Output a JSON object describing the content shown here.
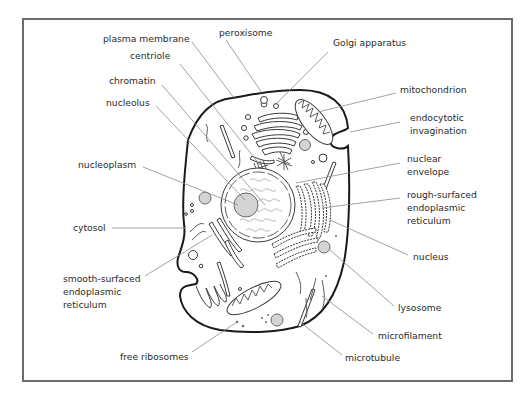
{
  "diagram": {
    "colors": {
      "frame": "#6b6b6b",
      "membrane": "#1a1a1a",
      "organelle_fill_grey": "#d4d4d4",
      "leader_line": "#8a8a8a",
      "text": "#2a2a2a"
    },
    "labels": [
      {
        "id": "plasma-membrane",
        "lines": [
          "plasma membrane"
        ],
        "x": 103,
        "y": 42,
        "anchor": "start",
        "leader": [
          [
            192,
            42
          ],
          [
            234,
            98
          ]
        ]
      },
      {
        "id": "centriole",
        "lines": [
          "centriole"
        ],
        "x": 130,
        "y": 59,
        "anchor": "start",
        "leader": [
          [
            180,
            64
          ],
          [
            260,
            165
          ]
        ]
      },
      {
        "id": "chromatin",
        "lines": [
          "chromatin"
        ],
        "x": 109,
        "y": 84,
        "anchor": "start",
        "leader": [
          [
            162,
            85
          ],
          [
            265,
            205
          ]
        ]
      },
      {
        "id": "nucleolus",
        "lines": [
          "nucleolus"
        ],
        "x": 106,
        "y": 106,
        "anchor": "start",
        "leader": [
          [
            156,
            106
          ],
          [
            245,
            200
          ]
        ]
      },
      {
        "id": "peroxisome",
        "lines": [
          "peroxisome"
        ],
        "x": 219,
        "y": 36,
        "anchor": "start",
        "leader": [
          [
            226,
            40
          ],
          [
            262,
            93
          ]
        ]
      },
      {
        "id": "golgi-apparatus",
        "lines": [
          "Golgi apparatus"
        ],
        "x": 333,
        "y": 46,
        "anchor": "start",
        "leader": [
          [
            328,
            52
          ],
          [
            275,
            105
          ]
        ]
      },
      {
        "id": "mitochondrion",
        "lines": [
          "mitochondrion"
        ],
        "x": 400,
        "y": 93,
        "anchor": "start",
        "leader": [
          [
            396,
            93
          ],
          [
            318,
            112
          ]
        ]
      },
      {
        "id": "endocytotic-invagination",
        "lines": [
          "endocytotic",
          "invagination"
        ],
        "x": 410,
        "y": 121,
        "anchor": "start",
        "leader": [
          [
            400,
            122
          ],
          [
            350,
            132
          ]
        ]
      },
      {
        "id": "nucleoplasm",
        "lines": [
          "nucleoplasm"
        ],
        "x": 78,
        "y": 168,
        "anchor": "start",
        "leader": [
          [
            143,
            167
          ],
          [
            238,
            205
          ]
        ]
      },
      {
        "id": "nuclear-envelope",
        "lines": [
          "nuclear",
          "envelope"
        ],
        "x": 407,
        "y": 162,
        "anchor": "start",
        "leader": [
          [
            400,
            163
          ],
          [
            296,
            183
          ]
        ]
      },
      {
        "id": "rough-surfaced-endoplasmic-reticulum",
        "lines": [
          "rough-surfaced",
          "endoplasmic",
          "reticulum"
        ],
        "x": 407,
        "y": 198,
        "anchor": "start",
        "leader": [
          [
            400,
            198
          ],
          [
            322,
            208
          ]
        ]
      },
      {
        "id": "cytosol",
        "lines": [
          "cytosol"
        ],
        "x": 73,
        "y": 231,
        "anchor": "start",
        "leader": [
          [
            112,
            228
          ],
          [
            185,
            228
          ]
        ]
      },
      {
        "id": "nucleus",
        "lines": [
          "nucleus"
        ],
        "x": 413,
        "y": 260,
        "anchor": "start",
        "leader": [
          [
            408,
            255
          ],
          [
            330,
            220
          ]
        ]
      },
      {
        "id": "smooth-surfaced-endoplasmic-reticulum",
        "lines": [
          "smooth-surfaced",
          "endoplasmic",
          "reticulum"
        ],
        "x": 63,
        "y": 282,
        "anchor": "start",
        "leader": [
          [
            145,
            276
          ],
          [
            212,
            235
          ]
        ]
      },
      {
        "id": "lysosome",
        "lines": [
          "lysosome"
        ],
        "x": 398,
        "y": 311,
        "anchor": "start",
        "leader": [
          [
            394,
            306
          ],
          [
            330,
            250
          ]
        ]
      },
      {
        "id": "microfilament",
        "lines": [
          "microfilament"
        ],
        "x": 378,
        "y": 339,
        "anchor": "start",
        "leader": [
          [
            373,
            334
          ],
          [
            322,
            296
          ]
        ]
      },
      {
        "id": "free-ribosomes",
        "lines": [
          "free ribosomes"
        ],
        "x": 120,
        "y": 360,
        "anchor": "start",
        "leader": [
          [
            192,
            352
          ],
          [
            237,
            322
          ]
        ]
      },
      {
        "id": "microtubule",
        "lines": [
          "microtubule"
        ],
        "x": 345,
        "y": 361,
        "anchor": "start",
        "leader": [
          [
            342,
            355
          ],
          [
            300,
            322
          ]
        ]
      }
    ]
  }
}
